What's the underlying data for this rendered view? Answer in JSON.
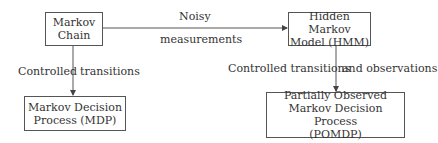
{
  "diagram": {
    "nodes": {
      "markov_chain": {
        "lines": [
          "Markov",
          "Chain"
        ]
      },
      "hmm": {
        "lines": [
          "Hidden Markov",
          "Model (HMM)"
        ]
      },
      "mdp": {
        "lines": [
          "Markov Decision",
          "Process (MDP)"
        ]
      },
      "pomdp": {
        "lines": [
          "Partially Observed",
          "Markov Decision Process",
          "(POMDP)"
        ]
      }
    },
    "edges": {
      "mc_to_hmm": {
        "label_top": "Noisy",
        "label_bottom": "measurements"
      },
      "mc_to_mdp": {
        "label_left": "Controlled",
        "label_right": "transitions"
      },
      "hmm_to_pomdp": {
        "label_left": "Controlled transitions",
        "label_right": "and observations"
      }
    }
  }
}
